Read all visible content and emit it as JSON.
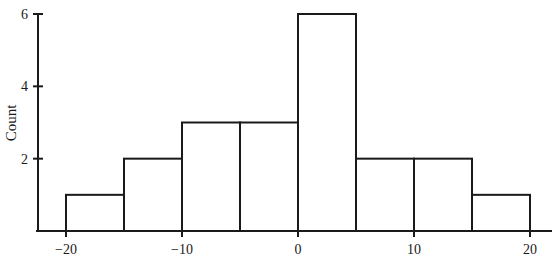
{
  "chart_data": {
    "type": "bar",
    "subtype": "histogram",
    "title": "",
    "xlabel": "",
    "ylabel": "Count",
    "bin_edges": [
      -20,
      -15,
      -10,
      -5,
      0,
      5,
      10,
      15,
      20
    ],
    "categories": [
      "-20 to -15",
      "-15 to -10",
      "-10 to -5",
      "-5 to 0",
      "0 to 5",
      "5 to 10",
      "10 to 15",
      "15 to 20"
    ],
    "values": [
      1,
      2,
      3,
      3,
      6,
      2,
      2,
      1
    ],
    "xlim": [
      -22.5,
      22
    ],
    "ylim": [
      0,
      6
    ],
    "x_ticks": [
      -20,
      -10,
      0,
      10,
      20
    ],
    "x_tick_labels": [
      "−20",
      "−10",
      "0",
      "10",
      "20"
    ],
    "y_ticks": [
      2,
      4,
      6
    ],
    "y_tick_labels": [
      "2",
      "4",
      "6"
    ],
    "grid": false,
    "legend": null,
    "bar_fill": "#ffffff",
    "bar_stroke": "#1a1a1a"
  }
}
